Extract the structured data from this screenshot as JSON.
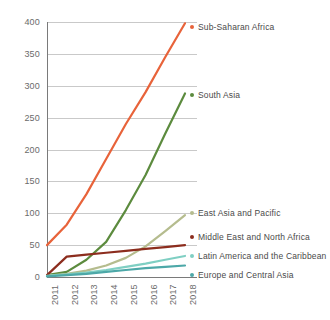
{
  "chart_data": {
    "type": "line",
    "title": "",
    "subtitle": "",
    "xlabel": "",
    "ylabel": "",
    "categories": [
      "2011",
      "2012",
      "2013",
      "2014",
      "2015",
      "2016",
      "2017",
      "2018"
    ],
    "x": [
      2011,
      2012,
      2013,
      2014,
      2015,
      2016,
      2017,
      2018
    ],
    "xlim": [
      2011,
      2018
    ],
    "ylim": [
      0,
      400
    ],
    "y_ticks": [
      0,
      50,
      100,
      150,
      200,
      250,
      300,
      350,
      400
    ],
    "y_tick_labels": [
      "0",
      "50",
      "100",
      "150",
      "200",
      "250",
      "300",
      "350",
      "400"
    ],
    "grid": true,
    "grid_axis": "y",
    "legend_position": "right-inline-at-line-end",
    "series": [
      {
        "name": "Sub-Saharan Africa",
        "color": "#E8633A",
        "values": [
          50,
          82,
          130,
          185,
          240,
          290,
          345,
          398
        ]
      },
      {
        "name": "South Asia",
        "color": "#5C8B3E",
        "values": [
          3,
          8,
          27,
          55,
          105,
          160,
          225,
          288
        ]
      },
      {
        "name": "East Asia and Pacific",
        "color": "#B5BC8E",
        "values": [
          2,
          5,
          10,
          18,
          30,
          48,
          72,
          97
        ]
      },
      {
        "name": "Middle East and North Africa",
        "color": "#8C2D1E",
        "values": [
          3,
          32,
          35,
          38,
          41,
          44,
          47,
          50
        ]
      },
      {
        "name": "Latin America and the Caribbean",
        "color": "#7FCFC3",
        "values": [
          2,
          4,
          7,
          11,
          16,
          21,
          27,
          33
        ]
      },
      {
        "name": "Europe and Central Asia",
        "color": "#4DA8A8",
        "values": [
          1,
          3,
          5,
          8,
          11,
          14,
          16,
          18
        ]
      }
    ]
  },
  "legend": {
    "items": [
      {
        "label": "Sub-Saharan Africa",
        "color": "#E8633A",
        "y": 23
      },
      {
        "label": "South Asia",
        "color": "#5C8B3E",
        "y": 91
      },
      {
        "label": "East Asia and Pacific",
        "color": "#B5BC8E",
        "y": 209
      },
      {
        "label": "Middle East and North Africa",
        "color": "#8C2D1E",
        "y": 233
      },
      {
        "label": "Latin America and the Caribbean",
        "color": "#7FCFC3",
        "y": 252
      },
      {
        "label": "Europe and Central Asia",
        "color": "#4DA8A8",
        "y": 271
      }
    ]
  },
  "axes": {
    "axis_color": "#7a7a7a",
    "grid_color": "#c9c9c9",
    "tick_label_color": "#6b6b6b"
  },
  "canvas": {
    "background": "#ffffff",
    "plot_left": 47,
    "plot_right": 185,
    "plot_top": 22,
    "plot_bottom": 277
  }
}
